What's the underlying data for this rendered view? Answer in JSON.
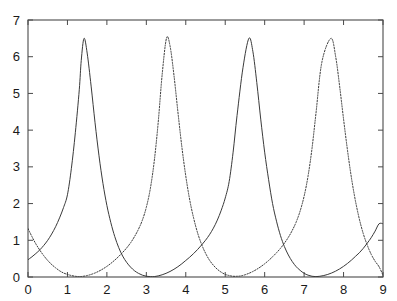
{
  "chart_data": {
    "type": "line",
    "title": "",
    "subtitle": "",
    "xlabel": "",
    "ylabel": "",
    "xlim": [
      0,
      9
    ],
    "ylim": [
      0,
      7
    ],
    "xticks": [
      0,
      1,
      2,
      3,
      4,
      5,
      6,
      7,
      8,
      9
    ],
    "yticks": [
      0,
      1,
      2,
      3,
      4,
      5,
      6,
      7
    ],
    "xtick_labels": [
      "0",
      "1",
      "2",
      "3",
      "4",
      "5",
      "6",
      "7",
      "8",
      "9"
    ],
    "ytick_labels": [
      "0",
      "1",
      "2",
      "3",
      "4",
      "5",
      "6",
      "7"
    ],
    "grid": false,
    "legend": "none",
    "frame": "box",
    "ticks_all_sides": true,
    "tick_direction": "in",
    "background": "#ffffff",
    "axis_color": "#4a4a4a",
    "series": [
      {
        "name": "curve-1",
        "style": "solid",
        "color": "#3a3a3a",
        "width": 1,
        "peak_value": 6.5,
        "trough_value": 0.0,
        "period": 4.19,
        "phase_peaks": [
          1.42,
          5.6
        ],
        "value_at_x0": 0.47,
        "value_at_x9": 1.45,
        "points": [
          [
            0.0,
            0.47
          ],
          [
            0.1,
            0.55
          ],
          [
            0.2,
            0.64
          ],
          [
            0.3,
            0.74
          ],
          [
            0.4,
            0.86
          ],
          [
            0.5,
            1.0
          ],
          [
            0.6,
            1.17
          ],
          [
            0.7,
            1.37
          ],
          [
            0.8,
            1.61
          ],
          [
            0.9,
            1.89
          ],
          [
            1.0,
            2.24
          ],
          [
            1.1,
            2.96
          ],
          [
            1.2,
            3.93
          ],
          [
            1.3,
            5.1
          ],
          [
            1.35,
            5.9
          ],
          [
            1.42,
            6.5
          ],
          [
            1.5,
            6.1
          ],
          [
            1.6,
            5.2
          ],
          [
            1.7,
            4.2
          ],
          [
            1.8,
            3.3
          ],
          [
            1.9,
            2.55
          ],
          [
            2.0,
            1.95
          ],
          [
            2.1,
            1.48
          ],
          [
            2.2,
            1.1
          ],
          [
            2.3,
            0.8
          ],
          [
            2.4,
            0.57
          ],
          [
            2.5,
            0.4
          ],
          [
            2.6,
            0.27
          ],
          [
            2.7,
            0.17
          ],
          [
            2.8,
            0.1
          ],
          [
            2.9,
            0.05
          ],
          [
            3.0,
            0.02
          ],
          [
            3.1,
            0.01
          ],
          [
            3.2,
            0.01
          ],
          [
            3.3,
            0.03
          ],
          [
            3.4,
            0.06
          ],
          [
            3.5,
            0.1
          ],
          [
            3.6,
            0.15
          ],
          [
            3.7,
            0.21
          ],
          [
            3.8,
            0.28
          ],
          [
            3.9,
            0.36
          ],
          [
            4.0,
            0.45
          ],
          [
            4.1,
            0.54
          ],
          [
            4.2,
            0.64
          ],
          [
            4.3,
            0.75
          ],
          [
            4.4,
            0.87
          ],
          [
            4.5,
            1.0
          ],
          [
            4.6,
            1.15
          ],
          [
            4.7,
            1.33
          ],
          [
            4.8,
            1.55
          ],
          [
            4.9,
            1.82
          ],
          [
            5.0,
            2.15
          ],
          [
            5.1,
            2.6
          ],
          [
            5.2,
            3.4
          ],
          [
            5.3,
            4.4
          ],
          [
            5.45,
            5.7
          ],
          [
            5.6,
            6.5
          ],
          [
            5.7,
            6.15
          ],
          [
            5.8,
            5.3
          ],
          [
            5.9,
            4.3
          ],
          [
            6.0,
            3.4
          ],
          [
            6.1,
            2.65
          ],
          [
            6.2,
            2.0
          ],
          [
            6.3,
            1.52
          ],
          [
            6.4,
            1.13
          ],
          [
            6.5,
            0.83
          ],
          [
            6.6,
            0.6
          ],
          [
            6.7,
            0.42
          ],
          [
            6.8,
            0.28
          ],
          [
            6.9,
            0.18
          ],
          [
            7.0,
            0.1
          ],
          [
            7.1,
            0.05
          ],
          [
            7.2,
            0.02
          ],
          [
            7.3,
            0.01
          ],
          [
            7.4,
            0.02
          ],
          [
            7.5,
            0.04
          ],
          [
            7.6,
            0.07
          ],
          [
            7.7,
            0.11
          ],
          [
            7.8,
            0.16
          ],
          [
            7.9,
            0.22
          ],
          [
            8.0,
            0.29
          ],
          [
            8.1,
            0.37
          ],
          [
            8.2,
            0.46
          ],
          [
            8.3,
            0.56
          ],
          [
            8.4,
            0.66
          ],
          [
            8.5,
            0.78
          ],
          [
            8.6,
            0.92
          ],
          [
            8.7,
            1.07
          ],
          [
            8.8,
            1.25
          ],
          [
            8.9,
            1.45
          ],
          [
            9.0,
            1.45
          ]
        ]
      },
      {
        "name": "curve-2",
        "style": "dotted",
        "color": "#3a3a3a",
        "width": 1,
        "peak_value": 6.5,
        "trough_value": 0.0,
        "period": 4.19,
        "phase_peaks": [
          3.51,
          7.68
        ],
        "value_at_x0": 1.32,
        "value_at_x9": 0.05,
        "points": [
          [
            0.0,
            1.32
          ],
          [
            0.1,
            1.1
          ],
          [
            0.2,
            0.9
          ],
          [
            0.3,
            0.73
          ],
          [
            0.4,
            0.58
          ],
          [
            0.5,
            0.45
          ],
          [
            0.6,
            0.34
          ],
          [
            0.7,
            0.25
          ],
          [
            0.8,
            0.17
          ],
          [
            0.9,
            0.11
          ],
          [
            1.0,
            0.07
          ],
          [
            1.1,
            0.04
          ],
          [
            1.2,
            0.02
          ],
          [
            1.3,
            0.01
          ],
          [
            1.4,
            0.02
          ],
          [
            1.5,
            0.04
          ],
          [
            1.6,
            0.07
          ],
          [
            1.7,
            0.11
          ],
          [
            1.8,
            0.16
          ],
          [
            1.9,
            0.22
          ],
          [
            2.0,
            0.29
          ],
          [
            2.1,
            0.37
          ],
          [
            2.2,
            0.46
          ],
          [
            2.3,
            0.56
          ],
          [
            2.4,
            0.67
          ],
          [
            2.5,
            0.79
          ],
          [
            2.6,
            0.93
          ],
          [
            2.7,
            1.1
          ],
          [
            2.8,
            1.3
          ],
          [
            2.9,
            1.55
          ],
          [
            3.0,
            1.9
          ],
          [
            3.1,
            2.4
          ],
          [
            3.2,
            3.15
          ],
          [
            3.3,
            4.2
          ],
          [
            3.4,
            5.5
          ],
          [
            3.51,
            6.5
          ],
          [
            3.6,
            6.3
          ],
          [
            3.7,
            5.5
          ],
          [
            3.8,
            4.5
          ],
          [
            3.9,
            3.55
          ],
          [
            4.0,
            2.75
          ],
          [
            4.1,
            2.1
          ],
          [
            4.2,
            1.6
          ],
          [
            4.3,
            1.2
          ],
          [
            4.4,
            0.89
          ],
          [
            4.5,
            0.65
          ],
          [
            4.6,
            0.46
          ],
          [
            4.7,
            0.32
          ],
          [
            4.8,
            0.21
          ],
          [
            4.9,
            0.13
          ],
          [
            5.0,
            0.07
          ],
          [
            5.1,
            0.04
          ],
          [
            5.2,
            0.02
          ],
          [
            5.3,
            0.02
          ],
          [
            5.4,
            0.03
          ],
          [
            5.5,
            0.06
          ],
          [
            5.6,
            0.1
          ],
          [
            5.7,
            0.15
          ],
          [
            5.8,
            0.21
          ],
          [
            5.9,
            0.28
          ],
          [
            6.0,
            0.36
          ],
          [
            6.1,
            0.45
          ],
          [
            6.2,
            0.55
          ],
          [
            6.3,
            0.66
          ],
          [
            6.4,
            0.78
          ],
          [
            6.5,
            0.92
          ],
          [
            6.6,
            1.08
          ],
          [
            6.7,
            1.27
          ],
          [
            6.8,
            1.5
          ],
          [
            6.9,
            1.8
          ],
          [
            7.0,
            2.2
          ],
          [
            7.1,
            2.75
          ],
          [
            7.2,
            3.5
          ],
          [
            7.3,
            4.45
          ],
          [
            7.45,
            5.85
          ],
          [
            7.68,
            6.5
          ],
          [
            7.8,
            6.0
          ],
          [
            7.9,
            5.2
          ],
          [
            8.0,
            4.3
          ],
          [
            8.1,
            3.45
          ],
          [
            8.2,
            2.7
          ],
          [
            8.3,
            2.08
          ],
          [
            8.4,
            1.58
          ],
          [
            8.5,
            1.18
          ],
          [
            8.6,
            0.87
          ],
          [
            8.7,
            0.62
          ],
          [
            8.8,
            0.43
          ],
          [
            8.9,
            0.28
          ],
          [
            9.0,
            0.05
          ]
        ]
      }
    ]
  },
  "figure": {
    "width": 397,
    "height": 301,
    "plot_left": 28,
    "plot_top": 20,
    "plot_right": 383,
    "plot_bottom": 277
  }
}
